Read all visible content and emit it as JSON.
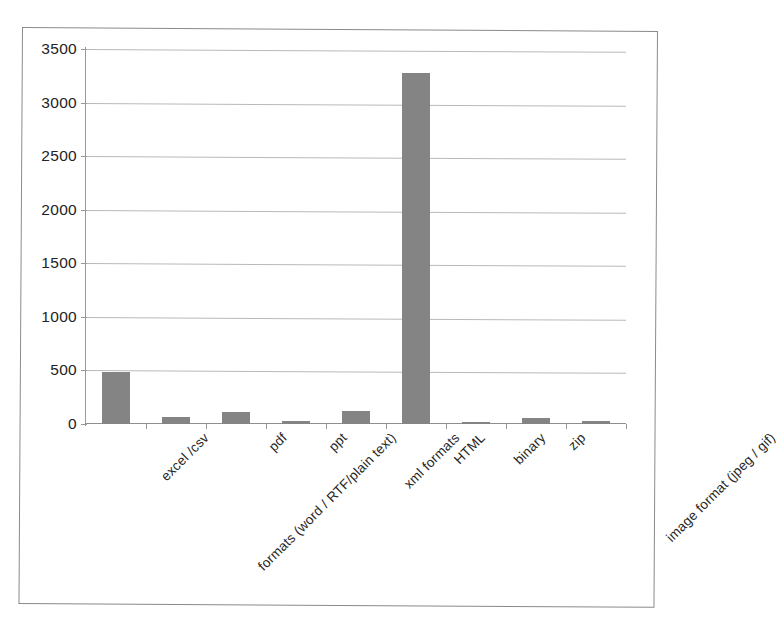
{
  "chart_data": {
    "type": "bar",
    "title": "",
    "subtitle": "",
    "xlabel": "",
    "ylabel": "",
    "categories": [
      "excel /csv",
      "formats (word / RTF/plain text)",
      "pdf",
      "ppt",
      "xml formats",
      "HTML",
      "binary",
      "zip",
      "image format (jpeg / gif)"
    ],
    "values": [
      490,
      65,
      110,
      25,
      125,
      3280,
      20,
      55,
      25
    ],
    "ylim": [
      0,
      3500
    ],
    "yticks": [
      0,
      500,
      1000,
      1500,
      2000,
      2500,
      3000,
      3500
    ],
    "ytick_labels": [
      "0",
      "500",
      "1000",
      "1500",
      "2000",
      "2500",
      "3000",
      "3500"
    ],
    "grid": true,
    "legend": false,
    "legend_position": "none",
    "bar_color": "#848484",
    "gridline_color": "#b9b9b9",
    "axis_color": "#8f8f8f",
    "frame_color": "#8b8b8b",
    "background_color": "#ffffff"
  }
}
